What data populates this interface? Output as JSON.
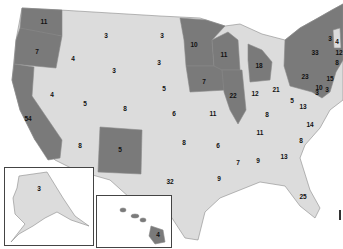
{
  "map": {
    "title": "",
    "shading": {
      "dark": "#7a7a7a",
      "light": "#dcdcdc",
      "border": "#8a8a8a"
    },
    "states": [
      {
        "name": "Washington",
        "votes": "11",
        "shade": "dark",
        "x": 44,
        "y": 22
      },
      {
        "name": "Oregon",
        "votes": "7",
        "shade": "dark",
        "x": 37,
        "y": 52
      },
      {
        "name": "California",
        "votes": "54",
        "shade": "dark",
        "x": 28,
        "y": 119
      },
      {
        "name": "Idaho",
        "votes": "4",
        "shade": "light",
        "x": 73,
        "y": 59
      },
      {
        "name": "Nevada",
        "votes": "4",
        "shade": "light",
        "x": 52,
        "y": 95
      },
      {
        "name": "Montana",
        "votes": "3",
        "shade": "light",
        "x": 106,
        "y": 36
      },
      {
        "name": "Wyoming",
        "votes": "3",
        "shade": "light",
        "x": 114,
        "y": 71
      },
      {
        "name": "Utah",
        "votes": "5",
        "shade": "light",
        "x": 85,
        "y": 104
      },
      {
        "name": "Colorado",
        "votes": "8",
        "shade": "light",
        "x": 125,
        "y": 109
      },
      {
        "name": "Arizona",
        "votes": "8",
        "shade": "light",
        "x": 80,
        "y": 146
      },
      {
        "name": "New Mexico",
        "votes": "5",
        "shade": "dark",
        "x": 120,
        "y": 150
      },
      {
        "name": "North Dakota",
        "votes": "3",
        "shade": "light",
        "x": 162,
        "y": 36
      },
      {
        "name": "South Dakota",
        "votes": "3",
        "shade": "light",
        "x": 159,
        "y": 63
      },
      {
        "name": "Nebraska",
        "votes": "5",
        "shade": "light",
        "x": 164,
        "y": 89
      },
      {
        "name": "Kansas",
        "votes": "6",
        "shade": "light",
        "x": 174,
        "y": 114
      },
      {
        "name": "Oklahoma",
        "votes": "8",
        "shade": "light",
        "x": 184,
        "y": 143
      },
      {
        "name": "Texas",
        "votes": "32",
        "shade": "light",
        "x": 170,
        "y": 182
      },
      {
        "name": "Minnesota",
        "votes": "10",
        "shade": "dark",
        "x": 194,
        "y": 45
      },
      {
        "name": "Iowa",
        "votes": "7",
        "shade": "dark",
        "x": 204,
        "y": 82
      },
      {
        "name": "Missouri",
        "votes": "11",
        "shade": "light",
        "x": 213,
        "y": 114
      },
      {
        "name": "Arkansas",
        "votes": "6",
        "shade": "light",
        "x": 218,
        "y": 146
      },
      {
        "name": "Louisiana",
        "votes": "9",
        "shade": "light",
        "x": 219,
        "y": 179
      },
      {
        "name": "Wisconsin",
        "votes": "11",
        "shade": "dark",
        "x": 224,
        "y": 55
      },
      {
        "name": "Illinois",
        "votes": "22",
        "shade": "dark",
        "x": 233,
        "y": 96
      },
      {
        "name": "Michigan",
        "votes": "18",
        "shade": "dark",
        "x": 259,
        "y": 66
      },
      {
        "name": "Indiana",
        "votes": "12",
        "shade": "light",
        "x": 255,
        "y": 94
      },
      {
        "name": "Ohio",
        "votes": "21",
        "shade": "light",
        "x": 276,
        "y": 90
      },
      {
        "name": "Kentucky",
        "votes": "8",
        "shade": "light",
        "x": 267,
        "y": 115
      },
      {
        "name": "Tennessee",
        "votes": "11",
        "shade": "light",
        "x": 260,
        "y": 133
      },
      {
        "name": "Mississippi",
        "votes": "7",
        "shade": "light",
        "x": 238,
        "y": 163
      },
      {
        "name": "Alabama",
        "votes": "9",
        "shade": "light",
        "x": 258,
        "y": 161
      },
      {
        "name": "Georgia",
        "votes": "13",
        "shade": "light",
        "x": 284,
        "y": 157
      },
      {
        "name": "Florida",
        "votes": "25",
        "shade": "light",
        "x": 303,
        "y": 197
      },
      {
        "name": "South Carolina",
        "votes": "8",
        "shade": "light",
        "x": 301,
        "y": 141
      },
      {
        "name": "North Carolina",
        "votes": "14",
        "shade": "light",
        "x": 310,
        "y": 125
      },
      {
        "name": "Virginia",
        "votes": "13",
        "shade": "light",
        "x": 303,
        "y": 107
      },
      {
        "name": "West Virginia",
        "votes": "5",
        "shade": "light",
        "x": 292,
        "y": 101
      },
      {
        "name": "Pennsylvania",
        "votes": "23",
        "shade": "dark",
        "x": 305,
        "y": 77
      },
      {
        "name": "New York",
        "votes": "33",
        "shade": "dark",
        "x": 315,
        "y": 53
      },
      {
        "name": "Vermont",
        "votes": "3",
        "shade": "dark",
        "x": 330,
        "y": 39
      },
      {
        "name": "New Hampshire",
        "votes": "4",
        "shade": "light",
        "x": 337,
        "y": 42
      },
      {
        "name": "Massachusetts",
        "votes": "12",
        "shade": "dark",
        "x": 339,
        "y": 53
      },
      {
        "name": "Connecticut",
        "votes": "8",
        "shade": "dark",
        "x": 337,
        "y": 63
      },
      {
        "name": "New Jersey",
        "votes": "15",
        "shade": "dark",
        "x": 330,
        "y": 79
      },
      {
        "name": "Maryland",
        "votes": "10",
        "shade": "dark",
        "x": 319,
        "y": 88
      },
      {
        "name": "Delaware",
        "votes": "3",
        "shade": "dark",
        "x": 327,
        "y": 90
      },
      {
        "name": "DC",
        "votes": "3",
        "shade": "dark",
        "x": 317,
        "y": 93
      },
      {
        "name": "Alaska",
        "votes": "3",
        "shade": "light",
        "x": 39,
        "y": 189
      },
      {
        "name": "Hawaii",
        "votes": "4",
        "shade": "dark",
        "x": 158,
        "y": 235
      }
    ],
    "insets": [
      {
        "name": "alaska-inset",
        "x": 4,
        "y": 167,
        "w": 88,
        "h": 77
      },
      {
        "name": "hawaii-inset",
        "x": 96,
        "y": 195,
        "w": 74,
        "h": 51
      }
    ]
  }
}
